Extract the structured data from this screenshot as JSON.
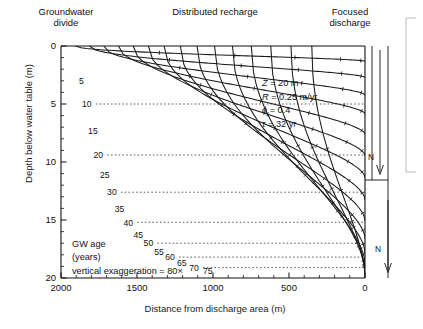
{
  "headers": {
    "divide": "Groundwater\ndivide",
    "divide_line1": "Groundwater",
    "divide_line2": "divide",
    "recharge": "Distributed recharge",
    "focused_line1": "Focused",
    "focused_line2": "discharge"
  },
  "annotations": {
    "gw_age_line1": "GW age",
    "gw_age_line2": "(years)",
    "vertical_exaggeration": "vertical exaggeration = 80×",
    "n_upper": "N",
    "n_lower": "N"
  },
  "parameters": [
    {
      "symbol": "Z",
      "rest": " = 20 m"
    },
    {
      "symbol": "R",
      "rest": " = 0.25 m/yr"
    },
    {
      "symbol": "ϕ",
      "rest": " = 0.4"
    },
    {
      "symbol": "τ",
      "rest": " = 32 yr"
    }
  ],
  "colors": {
    "axis": "#111111",
    "curve": "#1a1a1a",
    "dotted": "#333333",
    "text": "#111111",
    "background": "#ffffff"
  },
  "chart_data": {
    "type": "line",
    "title": "",
    "xlabel": "Distance from discharge area (m)",
    "ylabel": "Depth below water table (m)",
    "xlim": [
      2000,
      0
    ],
    "ylim": [
      20,
      0
    ],
    "x_reversed": true,
    "y_inverted": true,
    "grid": false,
    "legend": "none",
    "x_ticks_major": [
      2000,
      1500,
      1000,
      500,
      0
    ],
    "x_ticks_major_labels": [
      "2000",
      "1500",
      "1000",
      "500",
      "0"
    ],
    "x_tick_minor_step": 100,
    "y_ticks_major": [
      0,
      5,
      10,
      15,
      20
    ],
    "y_ticks_major_labels": [
      "0",
      "5",
      "10",
      "15",
      "20"
    ],
    "y_tick_minor_step": 1,
    "contour_variable": "groundwater age",
    "contour_units": "years",
    "contour_interval": 5,
    "series": [
      {
        "name": "5",
        "label": "5",
        "label_x": 1865,
        "label_y": 3.0,
        "x_at_top": 1905,
        "depth_at_outlet": 1.31
      },
      {
        "name": "10",
        "label": "10",
        "label_x": 1830,
        "label_y": 5.0,
        "x_at_top": 1812,
        "depth_at_outlet": 2.71
      },
      {
        "name": "15",
        "label": "15",
        "label_x": 1790,
        "label_y": 7.3,
        "x_at_top": 1718,
        "depth_at_outlet": 4.22
      },
      {
        "name": "20",
        "label": "20",
        "label_x": 1755,
        "label_y": 9.4,
        "x_at_top": 1622,
        "depth_at_outlet": 5.85
      },
      {
        "name": "25",
        "label": "25",
        "label_x": 1712,
        "label_y": 11.1,
        "x_at_top": 1525,
        "depth_at_outlet": 7.6
      },
      {
        "name": "30",
        "label": "30",
        "label_x": 1665,
        "label_y": 12.6,
        "x_at_top": 1425,
        "depth_at_outlet": 9.44
      },
      {
        "name": "35",
        "label": "35",
        "label_x": 1615,
        "label_y": 14.0,
        "x_at_top": 1322,
        "depth_at_outlet": 11.35
      },
      {
        "name": "40",
        "label": "40",
        "label_x": 1558,
        "label_y": 15.2,
        "x_at_top": 1215,
        "depth_at_outlet": 13.25
      },
      {
        "name": "45",
        "label": "45",
        "label_x": 1492,
        "label_y": 16.3,
        "x_at_top": 1105,
        "depth_at_outlet": 15.05
      },
      {
        "name": "50",
        "label": "50",
        "label_x": 1425,
        "label_y": 17.0,
        "x_at_top": 990,
        "depth_at_outlet": 16.6
      },
      {
        "name": "55",
        "label": "55",
        "label_x": 1355,
        "label_y": 17.7,
        "x_at_top": 872,
        "depth_at_outlet": 17.85
      },
      {
        "name": "60",
        "label": "60",
        "label_x": 1282,
        "label_y": 18.2,
        "x_at_top": 748,
        "depth_at_outlet": 18.75
      },
      {
        "name": "65",
        "label": "65",
        "label_x": 1205,
        "label_y": 18.7,
        "x_at_top": 620,
        "depth_at_outlet": 19.35
      },
      {
        "name": "70",
        "label": "70",
        "label_x": 1125,
        "label_y": 19.1,
        "x_at_top": 487,
        "depth_at_outlet": 19.7
      },
      {
        "name": "75",
        "label": "75",
        "label_x": 1035,
        "label_y": 19.4,
        "x_at_top": 350,
        "depth_at_outlet": 19.9
      }
    ],
    "dotted_reference_lines": [
      {
        "age": 10,
        "depth": 5.0
      },
      {
        "age": 20,
        "depth": 9.4
      },
      {
        "age": 30,
        "depth": 12.6
      },
      {
        "age": 40,
        "depth": 15.2
      },
      {
        "age": 50,
        "depth": 17.0
      },
      {
        "age": 60,
        "depth": 18.2
      },
      {
        "age": 70,
        "depth": 19.1
      }
    ],
    "model_parameters": {
      "Z": "20 m",
      "R": "0.25 m/yr",
      "phi": "0.4",
      "tau": "32 yr"
    },
    "vertical_exaggeration": "80×"
  }
}
